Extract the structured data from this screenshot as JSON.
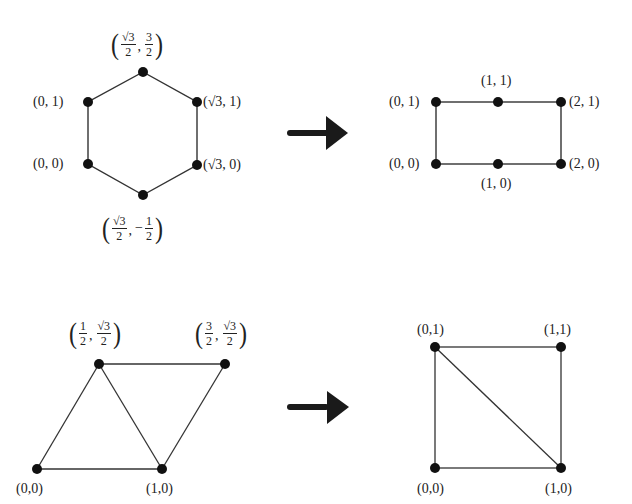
{
  "diagrams": [
    {
      "name": "hexagon-to-rectangle",
      "source": {
        "shape": "hexagon",
        "vertices": [
          {
            "id": "h0",
            "label": "(0, 0)",
            "x": 88,
            "y": 164
          },
          {
            "id": "h1",
            "label": "(0, 1)",
            "x": 88,
            "y": 102
          },
          {
            "id": "h2",
            "label": "(√3/2, 3/2)",
            "x": 143,
            "y": 72
          },
          {
            "id": "h3",
            "label": "(√3, 1)",
            "x": 197,
            "y": 102
          },
          {
            "id": "h4",
            "label": "(√3, 0)",
            "x": 197,
            "y": 165
          },
          {
            "id": "h5",
            "label": "(√3/2, −1/2)",
            "x": 143,
            "y": 195
          }
        ],
        "edges": [
          [
            "h0",
            "h1"
          ],
          [
            "h1",
            "h2"
          ],
          [
            "h2",
            "h3"
          ],
          [
            "h3",
            "h4"
          ],
          [
            "h4",
            "h5"
          ],
          [
            "h5",
            "h0"
          ]
        ]
      },
      "arrow": {
        "direction": "right"
      },
      "target": {
        "shape": "rectangle",
        "vertices": [
          {
            "id": "r0",
            "label": "(0, 0)",
            "x": 436,
            "y": 164
          },
          {
            "id": "r1",
            "label": "(1, 0)",
            "x": 498,
            "y": 164
          },
          {
            "id": "r2",
            "label": "(2, 0)",
            "x": 561,
            "y": 164
          },
          {
            "id": "r3",
            "label": "(0, 1)",
            "x": 436,
            "y": 102
          },
          {
            "id": "r4",
            "label": "(1, 1)",
            "x": 498,
            "y": 102
          },
          {
            "id": "r5",
            "label": "(2, 1)",
            "x": 561,
            "y": 102
          }
        ],
        "edges": [
          [
            "r0",
            "r1"
          ],
          [
            "r1",
            "r2"
          ],
          [
            "r2",
            "r5"
          ],
          [
            "r5",
            "r4"
          ],
          [
            "r4",
            "r3"
          ],
          [
            "r3",
            "r0"
          ]
        ]
      }
    },
    {
      "name": "parallelogram-to-square",
      "source": {
        "shape": "parallelogram-two-triangles",
        "vertices": [
          {
            "id": "p0",
            "label": "(0,0)",
            "x": 37,
            "y": 469
          },
          {
            "id": "p1",
            "label": "(1,0)",
            "x": 162,
            "y": 469
          },
          {
            "id": "p2",
            "label": "(1/2, √3/2)",
            "x": 99,
            "y": 364
          },
          {
            "id": "p3",
            "label": "(3/2, √3/2)",
            "x": 225,
            "y": 364
          }
        ],
        "edges": [
          [
            "p0",
            "p1"
          ],
          [
            "p0",
            "p2"
          ],
          [
            "p2",
            "p1"
          ],
          [
            "p2",
            "p3"
          ],
          [
            "p3",
            "p1"
          ]
        ]
      },
      "arrow": {
        "direction": "right"
      },
      "target": {
        "shape": "square-with-diagonal",
        "vertices": [
          {
            "id": "s0",
            "label": "(0,0)",
            "x": 435,
            "y": 468
          },
          {
            "id": "s1",
            "label": "(1,0)",
            "x": 561,
            "y": 468
          },
          {
            "id": "s2",
            "label": "(0,1)",
            "x": 435,
            "y": 347
          },
          {
            "id": "s3",
            "label": "(1,1)",
            "x": 561,
            "y": 347
          }
        ],
        "edges": [
          [
            "s0",
            "s1"
          ],
          [
            "s1",
            "s3"
          ],
          [
            "s3",
            "s2"
          ],
          [
            "s2",
            "s0"
          ],
          [
            "s2",
            "s1"
          ]
        ]
      }
    }
  ],
  "labels": {
    "hex_0_1": "(0, 1)",
    "hex_0_0": "(0, 0)",
    "hex_r3_1": "(√3, 1)",
    "hex_r3_0": "(√3, 0)",
    "hex_top": {
      "a_num": "√3",
      "a_den": "2",
      "b_num": "3",
      "b_den": "2",
      "b_sign": ""
    },
    "hex_bottom": {
      "a_num": "√3",
      "a_den": "2",
      "b_num": "1",
      "b_den": "2",
      "b_sign": "−"
    },
    "rect_0_1": "(0, 1)",
    "rect_1_1": "(1, 1)",
    "rect_2_1": "(2, 1)",
    "rect_0_0": "(0, 0)",
    "rect_1_0": "(1, 0)",
    "rect_2_0": "(2, 0)",
    "para_left_top": {
      "a_num": "1",
      "a_den": "2",
      "b_num": "√3",
      "b_den": "2"
    },
    "para_right_top": {
      "a_num": "3",
      "a_den": "2",
      "b_num": "√3",
      "b_den": "2"
    },
    "para_0_0": "(0,0)",
    "para_1_0": "(1,0)",
    "sq_0_1": "(0,1)",
    "sq_1_1": "(1,1)",
    "sq_0_0": "(0,0)",
    "sq_1_0": "(1,0)"
  },
  "colors": {
    "stroke": "#333333",
    "vertex": "#111111",
    "arrow": "#1a1a1a"
  }
}
